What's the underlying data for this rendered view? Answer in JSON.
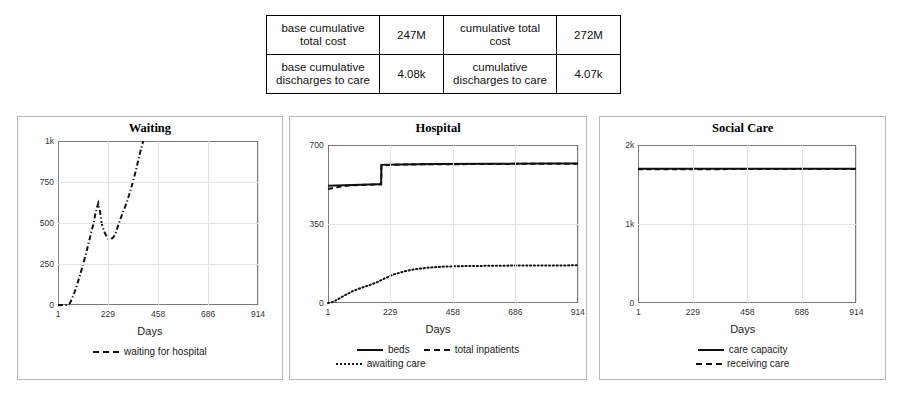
{
  "summary_table": {
    "rows": [
      {
        "label_left": "base cumulative total cost",
        "value_left": "247M",
        "label_right": "cumulative total cost",
        "value_right": "272M"
      },
      {
        "label_left": "base cumulative discharges to care",
        "value_left": "4.08k",
        "label_right": "cumulative discharges to care",
        "value_right": "4.07k"
      }
    ]
  },
  "panels": {
    "waiting": {
      "title": "Waiting",
      "xlabel": "Days",
      "legend": [
        {
          "label": "waiting for hospital",
          "style": "dashdot"
        }
      ]
    },
    "hospital": {
      "title": "Hospital",
      "xlabel": "Days",
      "legend": [
        {
          "label": "beds",
          "style": "solid"
        },
        {
          "label": "total inpatients",
          "style": "dashed"
        },
        {
          "label": "awaiting care",
          "style": "dotted"
        }
      ]
    },
    "social": {
      "title": "Social Care",
      "xlabel": "Days",
      "legend": [
        {
          "label": "care capacity",
          "style": "solid"
        },
        {
          "label": "receiving care",
          "style": "dashed"
        }
      ]
    }
  },
  "chart_data": [
    {
      "type": "line",
      "title": "Waiting",
      "xlabel": "Days",
      "ylabel": "",
      "xlim": [
        1,
        914
      ],
      "ylim": [
        0,
        1000
      ],
      "xticks": [
        1,
        229,
        458,
        686,
        914
      ],
      "xtick_labels": [
        "1",
        "229",
        "458",
        "686",
        "914"
      ],
      "yticks": [
        0,
        250,
        500,
        750,
        1000
      ],
      "ytick_labels": [
        "0",
        "250",
        "500",
        "750",
        "1k"
      ],
      "grid": true,
      "legend_position": "bottom",
      "series": [
        {
          "name": "waiting for hospital",
          "style": "dashdot",
          "color": "#111111",
          "x": [
            1,
            20,
            40,
            55,
            70,
            85,
            100,
            115,
            130,
            145,
            155,
            165,
            172,
            178,
            185,
            192,
            200,
            210,
            220,
            229,
            240,
            252,
            262,
            272,
            285,
            300,
            315,
            330,
            345,
            360,
            375,
            390
          ],
          "y": [
            0,
            0,
            0,
            10,
            55,
            110,
            175,
            245,
            320,
            400,
            455,
            505,
            560,
            590,
            620,
            575,
            500,
            455,
            425,
            405,
            400,
            410,
            430,
            470,
            520,
            575,
            625,
            690,
            760,
            840,
            925,
            1000
          ]
        }
      ]
    },
    {
      "type": "line",
      "title": "Hospital",
      "xlabel": "Days",
      "ylabel": "",
      "xlim": [
        1,
        914
      ],
      "ylim": [
        0,
        700
      ],
      "xticks": [
        1,
        229,
        458,
        686,
        914
      ],
      "xtick_labels": [
        "1",
        "229",
        "458",
        "686",
        "914"
      ],
      "yticks": [
        0,
        350,
        700
      ],
      "ytick_labels": [
        "0",
        "350",
        "700"
      ],
      "grid": true,
      "legend_position": "bottom",
      "series": [
        {
          "name": "beds",
          "style": "solid",
          "color": "#111111",
          "x": [
            1,
            60,
            120,
            180,
            195,
            196,
            260,
            400,
            600,
            800,
            914
          ],
          "y": [
            520,
            522,
            524,
            526,
            526,
            612,
            614,
            616,
            617,
            618,
            618
          ]
        },
        {
          "name": "total inpatients",
          "style": "dashed",
          "color": "#111111",
          "x": [
            1,
            30,
            60,
            90,
            120,
            150,
            180,
            195,
            196,
            230,
            300,
            450,
            600,
            800,
            914
          ],
          "y": [
            505,
            512,
            518,
            522,
            523,
            524,
            525,
            526,
            608,
            612,
            614,
            615,
            616,
            617,
            617
          ]
        },
        {
          "name": "awaiting care",
          "style": "dotted",
          "color": "#111111",
          "x": [
            1,
            20,
            40,
            60,
            90,
            120,
            150,
            180,
            210,
            240,
            280,
            320,
            370,
            420,
            470,
            530,
            600,
            700,
            800,
            914
          ],
          "y": [
            0,
            5,
            18,
            33,
            52,
            66,
            78,
            92,
            110,
            126,
            140,
            150,
            157,
            161,
            163,
            164,
            165,
            166,
            166,
            167
          ]
        }
      ]
    },
    {
      "type": "line",
      "title": "Social Care",
      "xlabel": "Days",
      "ylabel": "",
      "xlim": [
        1,
        914
      ],
      "ylim": [
        0,
        2000
      ],
      "xticks": [
        1,
        229,
        458,
        686,
        914
      ],
      "xtick_labels": [
        "1",
        "229",
        "458",
        "686",
        "914"
      ],
      "yticks": [
        0,
        1000,
        2000
      ],
      "ytick_labels": [
        "0",
        "1k",
        "2k"
      ],
      "grid": true,
      "legend_position": "bottom",
      "series": [
        {
          "name": "care capacity",
          "style": "solid",
          "color": "#111111",
          "x": [
            1,
            229,
            458,
            686,
            914
          ],
          "y": [
            1700,
            1700,
            1700,
            1700,
            1700
          ]
        },
        {
          "name": "receiving care",
          "style": "dashed",
          "color": "#111111",
          "x": [
            1,
            229,
            458,
            686,
            914
          ],
          "y": [
            1692,
            1694,
            1695,
            1696,
            1696
          ]
        }
      ]
    }
  ]
}
